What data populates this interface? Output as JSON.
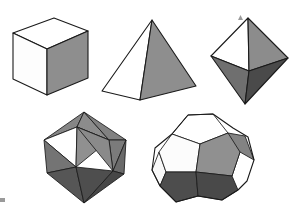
{
  "figure": {
    "background_color": "#ffffff",
    "outline_color": "#1a1a1a",
    "palette": {
      "white": "#ffffff",
      "light_gray": "#d0d0d0",
      "mid_gray": "#8a8a8a",
      "gray": "#7d7d7d",
      "dark_gray": "#4a4a4a",
      "darker_gray": "#3c3c3c"
    },
    "solids": [
      {
        "id": "cube",
        "name": "cube",
        "row": 1,
        "column": 1,
        "faces_total": 6,
        "face_shape": "square",
        "visible_faces": [
          {
            "name": "top-face",
            "shade": "white",
            "color": "#ffffff",
            "points": "13,33 54,18 88,31 47,49"
          },
          {
            "name": "left-face",
            "shade": "white",
            "color": "#fdfdfd",
            "points": "13,33 47,49 47,95 13,79"
          },
          {
            "name": "front-right-face",
            "shade": "mid_gray",
            "color": "#8e8e8e",
            "points": "47,49 88,31 88,78 47,95"
          }
        ]
      },
      {
        "id": "tetrahedron",
        "name": "tetrahedron",
        "row": 1,
        "column": 2,
        "faces_total": 4,
        "face_shape": "triangle",
        "visible_faces": [
          {
            "name": "left-face",
            "shade": "white",
            "color": "#ffffff",
            "points": "152,20 102,91 140,100"
          },
          {
            "name": "right-face",
            "shade": "mid_gray",
            "color": "#8e8e8e",
            "points": "152,20 196,86 140,100"
          }
        ]
      },
      {
        "id": "octahedron",
        "name": "octahedron",
        "row": 1,
        "column": 3,
        "faces_total": 8,
        "face_shape": "triangle",
        "visible_faces": [
          {
            "name": "upper-left-face",
            "shade": "white",
            "color": "#ffffff",
            "points": "248,18 211,56 249,71"
          },
          {
            "name": "upper-right-face",
            "shade": "mid_gray",
            "color": "#8c8c8c",
            "points": "248,18 288,58 249,71"
          },
          {
            "name": "lower-left-face",
            "shade": "gray",
            "color": "#6f6f6f",
            "points": "211,56 249,71 245,104"
          },
          {
            "name": "lower-right-face",
            "shade": "dark_gray",
            "color": "#4a4a4a",
            "points": "249,71 288,58 245,104"
          }
        ]
      },
      {
        "id": "icosahedron",
        "name": "icosahedron",
        "row": 2,
        "column": 1,
        "faces_total": 20,
        "face_shape": "triangle",
        "visible_faces": [
          {
            "name": "top-left-face",
            "shade": "mid_gray",
            "color": "#868686",
            "points": "84,112 44,140 77,127"
          },
          {
            "name": "top-center-face",
            "shade": "mid_gray",
            "color": "#8c8c8c",
            "points": "84,112 77,127 109,140"
          },
          {
            "name": "top-right-face",
            "shade": "mid_gray",
            "color": "#818181",
            "points": "84,112 109,140 126,140"
          },
          {
            "name": "upper-left-white-face",
            "shade": "white",
            "color": "#ffffff",
            "points": "44,140 77,127 76,167"
          },
          {
            "name": "upper-center-face",
            "shade": "mid_gray",
            "color": "#909090",
            "points": "77,127 109,140 76,167"
          },
          {
            "name": "upper-right-face",
            "shade": "gray",
            "color": "#7b7b7b",
            "points": "109,140 126,140 113,171"
          },
          {
            "name": "mid-center-face",
            "shade": "mid_gray",
            "color": "#8a8a8a",
            "points": "77,127 109,140 113,171"
          },
          {
            "name": "left-rim-face",
            "shade": "gray",
            "color": "#747474",
            "points": "44,140 76,167 47,173"
          },
          {
            "name": "right-rim-face",
            "shade": "gray",
            "color": "#6a6a6a",
            "points": "126,140 113,171 124,174"
          },
          {
            "name": "lower-left-face",
            "shade": "dark_gray",
            "color": "#565656",
            "points": "47,173 76,167 84,203"
          },
          {
            "name": "lower-center-face",
            "shade": "dark_gray",
            "color": "#4e4e4e",
            "points": "76,167 113,171 84,203"
          },
          {
            "name": "lower-right-face",
            "shade": "dark_gray",
            "color": "#474747",
            "points": "113,171 124,174 84,203"
          },
          {
            "name": "bottom-center-face",
            "shade": "darker_gray",
            "color": "#3f3f3f",
            "points": "76,167 84,203 113,171"
          }
        ]
      },
      {
        "id": "dodecahedron",
        "name": "dodecahedron",
        "row": 2,
        "column": 2,
        "faces_total": 12,
        "face_shape": "pentagon",
        "visible_faces": [
          {
            "name": "top-pentagon-face",
            "shade": "white",
            "color": "#ffffff",
            "points": "172,134 188,115 213,114 228,133 200,144"
          },
          {
            "name": "upper-left-face",
            "shade": "white",
            "color": "#fcfcfc",
            "points": "159,152 172,134 200,144 196,172 166,172"
          },
          {
            "name": "center-face",
            "shade": "mid_gray",
            "color": "#909090",
            "points": "200,144 228,133 240,152 232,176 196,172"
          },
          {
            "name": "right-face",
            "shade": "mid_gray",
            "color": "#838383",
            "points": "228,133 245,136 254,160 240,152 232,176"
          },
          {
            "name": "lower-left-face",
            "shade": "dark_gray",
            "color": "#4d4d4d",
            "points": "166,172 196,172 198,196 176,202 160,186"
          },
          {
            "name": "lower-right-face",
            "shade": "dark_gray",
            "color": "#494949",
            "points": "196,172 232,176 238,190 222,200 198,196"
          },
          {
            "name": "left-edge-face",
            "shade": "white",
            "color": "#f8f8f8",
            "points": "159,152 166,172 160,186 152,170"
          }
        ],
        "outline": "188,115 213,114 233,128 248,137 254,160 247,181 238,190 222,200 198,196 176,202 160,186 152,170 155,148 172,134"
      }
    ],
    "artifacts": [
      {
        "name": "speck-top-right",
        "x": 240,
        "y": 17,
        "size": 3
      },
      {
        "name": "speck-bottom-left",
        "x": 2,
        "y": 199,
        "size": 4
      }
    ]
  }
}
